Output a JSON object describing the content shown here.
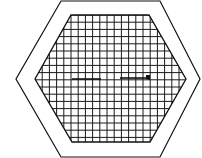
{
  "diagram": {
    "colors": {
      "background": "#ffffff",
      "stroke": "#111111",
      "grid": "#1a1a1a"
    },
    "outer_hexagon": {
      "points": "61,1 160,1 200,79 160,157 61,157 16,79"
    },
    "inner_hexagon": {
      "points": "71,15 149,15 186,79 150,142 72,142 35,79"
    },
    "grid": {
      "spacing": 7.2,
      "x_start": 35,
      "x_end": 186,
      "y_start": 15,
      "y_end": 142
    },
    "segments": [
      {
        "name": "left-line",
        "x1": 72,
        "y1": 79,
        "x2": 101,
        "y2": 79,
        "arrowhead": false
      },
      {
        "name": "right-arrow",
        "x1": 120,
        "y1": 78,
        "x2": 150,
        "y2": 78,
        "arrowhead": true
      }
    ]
  }
}
